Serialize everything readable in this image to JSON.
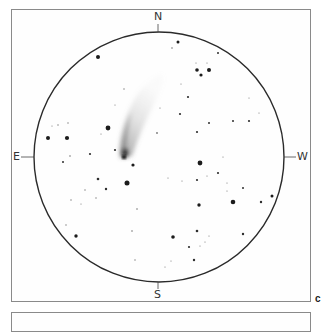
{
  "sketch": {
    "type": "comet field sketch",
    "panel_label": "c",
    "cardinals": {
      "north": "N",
      "south": "S",
      "east": "E",
      "west": "W"
    },
    "field_circle": {
      "cx": 159,
      "cy": 157,
      "r": 125,
      "stroke": "#2a2a2a"
    },
    "comet": {
      "nucleus": {
        "x": 124,
        "y": 157
      },
      "tail_direction": "north-northwest (upward, curving right)",
      "color": "#3a3a3a"
    },
    "stars": [
      {
        "x": 98,
        "y": 57,
        "r": 2.0
      },
      {
        "x": 178,
        "y": 42,
        "r": 1.5
      },
      {
        "x": 172,
        "y": 48,
        "r": 0.8
      },
      {
        "x": 197,
        "y": 70,
        "r": 1.8
      },
      {
        "x": 209,
        "y": 70,
        "r": 2.0
      },
      {
        "x": 201,
        "y": 75,
        "r": 1.6
      },
      {
        "x": 218,
        "y": 53,
        "r": 1.0
      },
      {
        "x": 188,
        "y": 97,
        "r": 1.1
      },
      {
        "x": 180,
        "y": 114,
        "r": 1.1
      },
      {
        "x": 209,
        "y": 123,
        "r": 1.0
      },
      {
        "x": 233,
        "y": 121,
        "r": 1.0
      },
      {
        "x": 249,
        "y": 121,
        "r": 1.1
      },
      {
        "x": 197,
        "y": 132,
        "r": 1.1
      },
      {
        "x": 157,
        "y": 133,
        "r": 0.9
      },
      {
        "x": 108,
        "y": 128,
        "r": 2.4
      },
      {
        "x": 48,
        "y": 138,
        "r": 2.0
      },
      {
        "x": 67,
        "y": 138,
        "r": 2.1
      },
      {
        "x": 90,
        "y": 154,
        "r": 1.1
      },
      {
        "x": 115,
        "y": 150,
        "r": 1.1
      },
      {
        "x": 133,
        "y": 165,
        "r": 1.6
      },
      {
        "x": 200,
        "y": 163,
        "r": 2.4
      },
      {
        "x": 218,
        "y": 173,
        "r": 1.1
      },
      {
        "x": 63,
        "y": 162,
        "r": 1.0
      },
      {
        "x": 98,
        "y": 179,
        "r": 1.3
      },
      {
        "x": 106,
        "y": 189,
        "r": 1.2
      },
      {
        "x": 127,
        "y": 183,
        "r": 2.5
      },
      {
        "x": 197,
        "y": 180,
        "r": 1.1
      },
      {
        "x": 243,
        "y": 188,
        "r": 1.0
      },
      {
        "x": 233,
        "y": 202,
        "r": 2.3
      },
      {
        "x": 261,
        "y": 202,
        "r": 1.2
      },
      {
        "x": 272,
        "y": 196,
        "r": 1.5
      },
      {
        "x": 199,
        "y": 205,
        "r": 1.7
      },
      {
        "x": 76,
        "y": 236,
        "r": 1.7
      },
      {
        "x": 173,
        "y": 237,
        "r": 1.8
      },
      {
        "x": 197,
        "y": 231,
        "r": 1.3
      },
      {
        "x": 243,
        "y": 234,
        "r": 1.2
      },
      {
        "x": 189,
        "y": 247,
        "r": 1.1
      },
      {
        "x": 194,
        "y": 260,
        "r": 1.2
      },
      {
        "x": 137,
        "y": 209,
        "r": 0.8
      },
      {
        "x": 124,
        "y": 89,
        "r": 0.7
      },
      {
        "x": 58,
        "y": 125,
        "r": 0.7
      },
      {
        "x": 68,
        "y": 123,
        "r": 0.7
      },
      {
        "x": 52,
        "y": 126,
        "r": 0.6
      },
      {
        "x": 70,
        "y": 156,
        "r": 0.8
      },
      {
        "x": 85,
        "y": 190,
        "r": 0.7
      },
      {
        "x": 96,
        "y": 198,
        "r": 0.7
      },
      {
        "x": 71,
        "y": 200,
        "r": 0.7
      },
      {
        "x": 81,
        "y": 204,
        "r": 0.6
      },
      {
        "x": 66,
        "y": 225,
        "r": 0.7
      },
      {
        "x": 132,
        "y": 231,
        "r": 0.8
      },
      {
        "x": 135,
        "y": 260,
        "r": 0.7
      },
      {
        "x": 165,
        "y": 267,
        "r": 0.6
      },
      {
        "x": 171,
        "y": 261,
        "r": 0.6
      },
      {
        "x": 182,
        "y": 181,
        "r": 0.6
      },
      {
        "x": 168,
        "y": 178,
        "r": 0.6
      },
      {
        "x": 207,
        "y": 176,
        "r": 0.6
      },
      {
        "x": 227,
        "y": 191,
        "r": 0.6
      },
      {
        "x": 200,
        "y": 246,
        "r": 0.6
      },
      {
        "x": 205,
        "y": 242,
        "r": 0.6
      },
      {
        "x": 209,
        "y": 236,
        "r": 0.6
      },
      {
        "x": 223,
        "y": 157,
        "r": 0.6
      },
      {
        "x": 249,
        "y": 98,
        "r": 0.6
      },
      {
        "x": 259,
        "y": 113,
        "r": 0.6
      },
      {
        "x": 196,
        "y": 63,
        "r": 0.6
      },
      {
        "x": 207,
        "y": 63,
        "r": 0.6
      },
      {
        "x": 181,
        "y": 84,
        "r": 0.6
      },
      {
        "x": 160,
        "y": 108,
        "r": 0.6
      },
      {
        "x": 115,
        "y": 105,
        "r": 0.6
      },
      {
        "x": 101,
        "y": 134,
        "r": 0.6
      },
      {
        "x": 227,
        "y": 183,
        "r": 0.6
      }
    ]
  }
}
